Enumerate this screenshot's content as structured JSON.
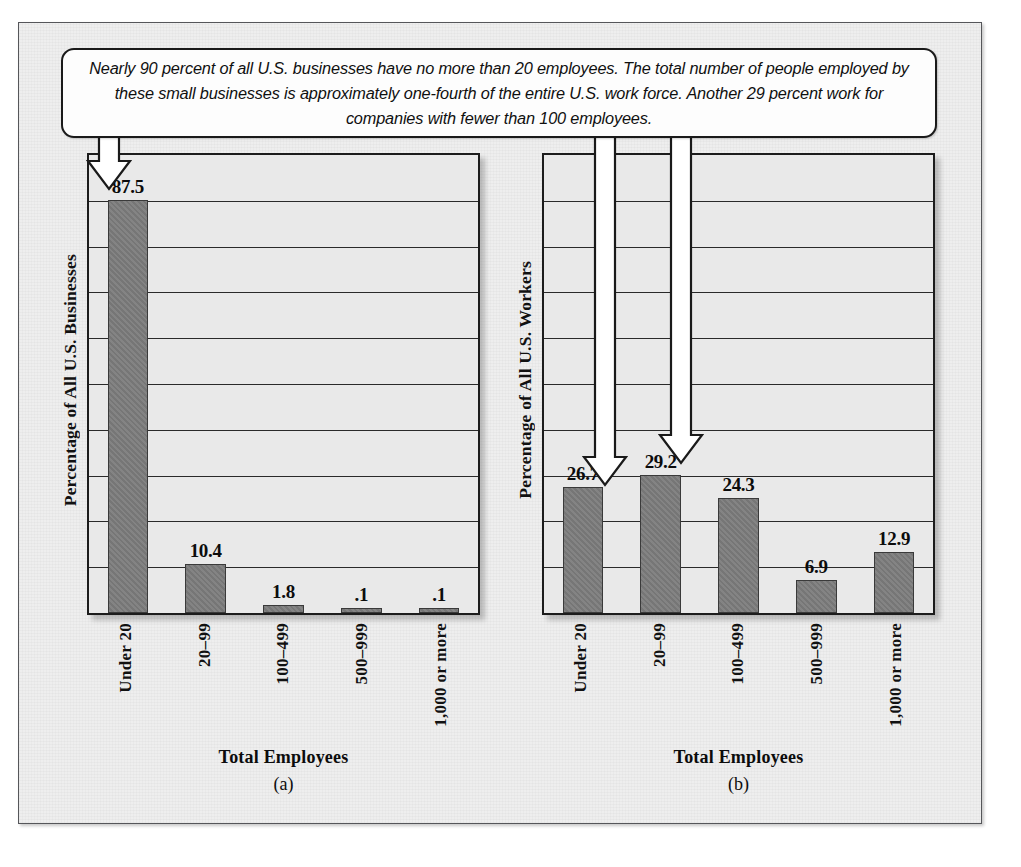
{
  "caption": {
    "text": "Nearly 90 percent of all U.S. businesses have no more than 20 employees. The total number of people employed by these small businesses is approximately one-fourth of the entire U.S. work force. Another 29 percent work for companies with fewer than 100 employees."
  },
  "colors": {
    "bar_fill": "#7c7c7c",
    "bar_stroke": "#3a3a3a",
    "plot_bg": "#e9e9e9",
    "page_bg": "#eeeeee",
    "frame_stroke": "#55565a",
    "text": "#0c0c0c",
    "arrow_fill": "#ffffff",
    "arrow_stroke": "#1a1a1a"
  },
  "chart_data": [
    {
      "type": "bar",
      "panel": "(a)",
      "title": "",
      "categories": [
        "Under 20",
        "20–99",
        "100–499",
        "500–999",
        "1,000 or more"
      ],
      "values": [
        87.5,
        10.4,
        1.8,
        0.1,
        0.1
      ],
      "value_labels": [
        "87.5",
        "10.4",
        "1.8",
        ".1",
        ".1"
      ],
      "xlabel": "Total Employees",
      "ylabel": "Percentage of All U.S. Businesses",
      "ylim": [
        0,
        97
      ],
      "gridlines": 9,
      "grid": true,
      "legend": "none",
      "annotations": [
        {
          "kind": "arrow",
          "points_to": "Under 20",
          "target_value": 87.5
        }
      ]
    },
    {
      "type": "bar",
      "panel": "(b)",
      "title": "",
      "categories": [
        "Under 20",
        "20–99",
        "100–499",
        "500–999",
        "1,000 or more"
      ],
      "values": [
        26.7,
        29.2,
        24.3,
        6.9,
        12.9
      ],
      "value_labels": [
        "26.7",
        "29.2",
        "24.3",
        "6.9",
        "12.9"
      ],
      "xlabel": "Total Employees",
      "ylabel": "Percentage of All U.S. Workers",
      "ylim": [
        0,
        97
      ],
      "gridlines": 9,
      "grid": true,
      "legend": "none",
      "annotations": [
        {
          "kind": "arrow",
          "points_to": "Under 20",
          "target_value": 26.7
        },
        {
          "kind": "arrow",
          "points_to": "20–99",
          "target_value": 29.2
        }
      ]
    }
  ]
}
